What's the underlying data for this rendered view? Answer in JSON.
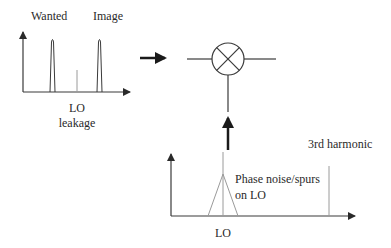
{
  "diagram": {
    "input_spectrum": {
      "labels": {
        "wanted": "Wanted",
        "image": "Image",
        "lo_leakage_line1": "LO",
        "lo_leakage_line2": "leakage"
      }
    },
    "mixer": {
      "symbol": "multiplier-circle-x"
    },
    "lo_spectrum": {
      "labels": {
        "third_harmonic": "3rd harmonic",
        "phase_noise_line1": "Phase noise/spurs",
        "phase_noise_line2": "on LO",
        "lo": "LO"
      }
    },
    "colors": {
      "line": "#3a3a3a",
      "thin_line": "#8a8a8a",
      "arrow": "#1a1a1a",
      "background": "#ffffff"
    }
  }
}
